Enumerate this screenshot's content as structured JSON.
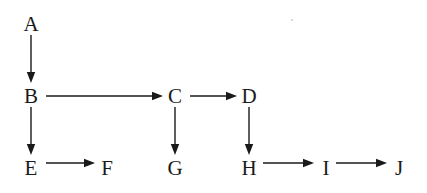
{
  "diagram": {
    "type": "directed-graph",
    "background_color": "#ffffff",
    "stroke_color": "#1a1a1a",
    "text_color": "#1a1a1a",
    "nodes": [
      {
        "id": "A",
        "label": "A",
        "x": 31,
        "y": 24
      },
      {
        "id": "B",
        "label": "B",
        "x": 31,
        "y": 96
      },
      {
        "id": "C",
        "label": "C",
        "x": 175,
        "y": 96
      },
      {
        "id": "D",
        "label": "D",
        "x": 249,
        "y": 96
      },
      {
        "id": "E",
        "label": "E",
        "x": 31,
        "y": 168
      },
      {
        "id": "F",
        "label": "F",
        "x": 107,
        "y": 168
      },
      {
        "id": "G",
        "label": "G",
        "x": 175,
        "y": 168
      },
      {
        "id": "H",
        "label": "H",
        "x": 249,
        "y": 168
      },
      {
        "id": "I",
        "label": "I",
        "x": 326,
        "y": 168
      },
      {
        "id": "J",
        "label": "J",
        "x": 399,
        "y": 168
      }
    ],
    "edges": [
      {
        "id": "A-B",
        "from": "A",
        "to": "B",
        "orientation": "vertical",
        "x1": 31,
        "y1": 35,
        "x2": 31,
        "y2": 83
      },
      {
        "id": "B-C",
        "from": "B",
        "to": "C",
        "orientation": "horizontal",
        "x1": 46,
        "y1": 96,
        "x2": 163,
        "y2": 96
      },
      {
        "id": "C-D",
        "from": "C",
        "to": "D",
        "orientation": "horizontal",
        "x1": 190,
        "y1": 96,
        "x2": 237,
        "y2": 96
      },
      {
        "id": "B-E",
        "from": "B",
        "to": "E",
        "orientation": "vertical",
        "x1": 31,
        "y1": 107,
        "x2": 31,
        "y2": 155
      },
      {
        "id": "C-G",
        "from": "C",
        "to": "G",
        "orientation": "vertical",
        "x1": 175,
        "y1": 107,
        "x2": 175,
        "y2": 155
      },
      {
        "id": "D-H",
        "from": "D",
        "to": "H",
        "orientation": "vertical",
        "x1": 249,
        "y1": 107,
        "x2": 249,
        "y2": 155
      },
      {
        "id": "E-F",
        "from": "E",
        "to": "F",
        "orientation": "horizontal",
        "x1": 46,
        "y1": 163,
        "x2": 95,
        "y2": 163
      },
      {
        "id": "H-I",
        "from": "H",
        "to": "I",
        "orientation": "horizontal",
        "x1": 263,
        "y1": 163,
        "x2": 314,
        "y2": 163
      },
      {
        "id": "I-J",
        "from": "I",
        "to": "J",
        "orientation": "horizontal",
        "x1": 336,
        "y1": 163,
        "x2": 387,
        "y2": 163
      }
    ],
    "arrowhead": {
      "length": 11,
      "half_width": 4.2
    },
    "artifacts": [
      {
        "id": "speck-1",
        "x": 292,
        "y": 20,
        "r": 1.1
      }
    ]
  }
}
